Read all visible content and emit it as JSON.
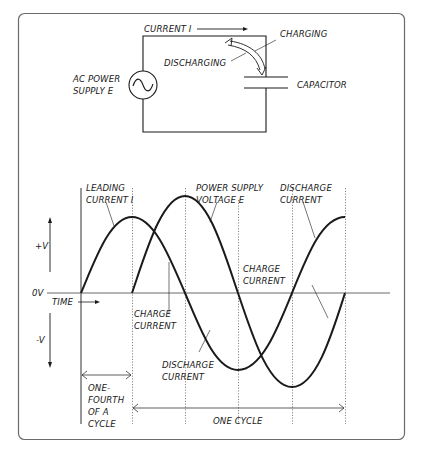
{
  "circuit": {
    "current_label": "CURRENT I",
    "charging_label": "CHARGING",
    "discharging_label": "DISCHARGING",
    "source_label_line1": "AC POWER",
    "source_label_line2": "SUPPLY E",
    "capacitor_label": "CAPACITOR",
    "source_icon": "ac-sine-source-icon",
    "capacitor_icon": "capacitor-icon"
  },
  "graph": {
    "y_axis": {
      "positive_label": "+V",
      "zero_label": "0V",
      "negative_label": "-V"
    },
    "x_axis": {
      "label": "TIME"
    },
    "annotations": {
      "leading_current_line1": "LEADING",
      "leading_current_line2": "CURRENT I",
      "voltage_line1": "POWER SUPPLY",
      "voltage_line2": "VOLTAGE E",
      "discharge_top_line1": "DISCHARGE",
      "discharge_top_line2": "CURRENT",
      "charge_right_line1": "CHARGE",
      "charge_right_line2": "CURRENT",
      "charge_left_line1": "CHARGE",
      "charge_left_line2": "CURRENT",
      "discharge_bottom_line1": "DISCHARGE",
      "discharge_bottom_line2": "CURRENT",
      "quarter_line1": "ONE-",
      "quarter_line2": "FOURTH",
      "quarter_line3": "OF A",
      "quarter_line4": "CYCLE",
      "one_cycle": "ONE CYCLE"
    },
    "series": [
      {
        "name": "Leading current I",
        "phase_lead_deg": 90,
        "start_quarter": 0,
        "amplitude": "smaller"
      },
      {
        "name": "Power supply voltage E",
        "phase_lead_deg": 0,
        "start_quarter": 1,
        "amplitude": "larger"
      }
    ]
  }
}
